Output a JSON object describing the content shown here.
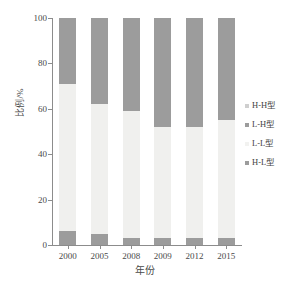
{
  "chart_data": {
    "type": "bar",
    "subtype": "stacked-100-percent",
    "title": "",
    "xlabel": "年份",
    "ylabel": "比例/%",
    "categories": [
      "2000",
      "2005",
      "2008",
      "2009",
      "2012",
      "2015"
    ],
    "ylim": [
      0,
      100
    ],
    "yticks": [
      0,
      20,
      40,
      60,
      80,
      100
    ],
    "grid": false,
    "legend_position": "right",
    "series": [
      {
        "name": "H-H型",
        "color": "#d9d9d9",
        "values": [
          0,
          0,
          0,
          0,
          0,
          0
        ]
      },
      {
        "name": "L-H型",
        "color": "#9c9c9c",
        "values": [
          29,
          38,
          41,
          48,
          48,
          45
        ]
      },
      {
        "name": "L-L型",
        "color": "#f0f0ee",
        "values": [
          65,
          57,
          56,
          49,
          49,
          52
        ]
      },
      {
        "name": "H-L型",
        "color": "#9c9c9c",
        "values": [
          6,
          5,
          3,
          3,
          3,
          3
        ]
      }
    ],
    "stack_order_bottom_to_top": [
      "H-L型",
      "L-L型",
      "L-H型",
      "H-H型"
    ],
    "colors": {
      "axis": "#8c8c8c",
      "text": "#4a4a4a",
      "gray_segment": "#9c9c9c",
      "light_segment": "#f0f0ee",
      "hh_swatch": "#d9d9d9",
      "background": "#ffffff"
    }
  },
  "legend": {
    "items": [
      {
        "label": "H-H型",
        "color": "#cfcfcf"
      },
      {
        "label": "L-H型",
        "color": "#9c9c9c"
      },
      {
        "label": "L-L型",
        "color": "#f2f2f0"
      },
      {
        "label": "H-L型",
        "color": "#9c9c9c"
      }
    ]
  }
}
